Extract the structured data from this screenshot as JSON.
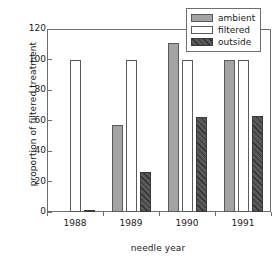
{
  "chart_data": {
    "type": "bar",
    "title": "",
    "xlabel": "needle year",
    "ylabel": "proportion of filtered treatment",
    "categories": [
      "1988",
      "1989",
      "1990",
      "1991"
    ],
    "series": [
      {
        "name": "ambient",
        "values": [
          0,
          57,
          111,
          99.5
        ]
      },
      {
        "name": "filtered",
        "values": [
          100,
          100,
          100,
          100
        ]
      },
      {
        "name": "outside",
        "values": [
          1,
          26,
          62,
          63
        ]
      }
    ],
    "ylim": [
      0,
      120
    ],
    "yticks": [
      0,
      20,
      40,
      60,
      80,
      100,
      120
    ],
    "ytick_labels": [
      "0",
      "20",
      "40",
      "60",
      "80",
      "100",
      "120"
    ],
    "grid": false,
    "legend_position": "top-right",
    "colors": {
      "ambient": "#a3a3a3",
      "filtered": "#ffffff",
      "outside": "#595959",
      "axis": "#6e6e6e",
      "text": "#1a1a1a",
      "background": "#ffffff"
    }
  },
  "legend": {
    "entries": [
      {
        "label": "ambient",
        "swatch": "ambient-swatch"
      },
      {
        "label": "filtered",
        "swatch": "filtered-swatch"
      },
      {
        "label": "outside",
        "swatch": "outside-swatch"
      }
    ]
  }
}
